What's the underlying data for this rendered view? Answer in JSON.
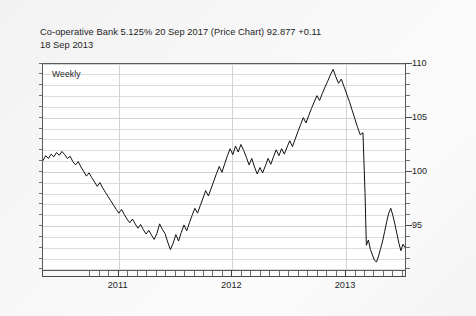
{
  "title": {
    "line1": "Co-operative Bank 5.125% 20 Sep 2017 (Price Chart) 92.877 +0.11",
    "line2": "18 Sep 2013"
  },
  "plot": {
    "frequency_label": "Weekly",
    "line_color": "#111111",
    "grid_color": "#dcdcdc",
    "axis_color": "#4a4a4a",
    "plot_background": "#ffffff",
    "page_background": "#f5f5f5"
  },
  "chart_data": {
    "type": "line",
    "title": "Co-operative Bank 5.125% 20 Sep 2017 (Price Chart) 92.877 +0.11",
    "subtitle": "18 Sep 2013",
    "annotation": "Weekly",
    "xlabel": "",
    "ylabel": "",
    "series_name": "Price",
    "last_price": 92.877,
    "change": 0.11,
    "as_of_date": "18 Sep 2013",
    "grid": true,
    "legend": "none",
    "y_axis_side": "right",
    "ylim": [
      90.8,
      110
    ],
    "yticks_major": [
      95,
      100,
      105,
      110
    ],
    "ytick_labels": [
      "95",
      "100",
      "105",
      "110"
    ],
    "ytick_minor_step": 1,
    "xlim": [
      "2010-09",
      "2013-09"
    ],
    "xticks_major": [
      "2011",
      "2012",
      "2013"
    ],
    "xtick_labels": [
      "2011",
      "2012",
      "2013"
    ],
    "xtick_minor_step": "1 month",
    "x": [
      "2010-09",
      "2010-10",
      "2010-11",
      "2010-12",
      "2011-01",
      "2011-02",
      "2011-03",
      "2011-04",
      "2011-05",
      "2011-06",
      "2011-07",
      "2011-08",
      "2011-09",
      "2011-10",
      "2011-11",
      "2011-12",
      "2012-01",
      "2012-02",
      "2012-03",
      "2012-04",
      "2012-05",
      "2012-06",
      "2012-07",
      "2012-08",
      "2012-09",
      "2012-10",
      "2012-11",
      "2012-12",
      "2013-01",
      "2013-02",
      "2013-03",
      "2013-04",
      "2013-05",
      "2013-06",
      "2013-07",
      "2013-08",
      "2013-09"
    ],
    "values": [
      101.0,
      101.5,
      101.2,
      100.3,
      99.2,
      98.3,
      97.4,
      96.2,
      95.3,
      94.6,
      94.2,
      93.4,
      94.1,
      95.6,
      97.4,
      99.3,
      101.3,
      102.4,
      102.0,
      101.0,
      99.9,
      100.6,
      101.5,
      102.0,
      101.4,
      102.6,
      104.5,
      105.6,
      106.6,
      107.3,
      108.3,
      109.5,
      108.2,
      104.0,
      92.8,
      91.6,
      92.9
    ],
    "points": [
      [
        0.0,
        101.0
      ],
      [
        0.008,
        101.45
      ],
      [
        0.016,
        101.2
      ],
      [
        0.024,
        101.6
      ],
      [
        0.032,
        101.35
      ],
      [
        0.04,
        101.75
      ],
      [
        0.048,
        101.5
      ],
      [
        0.056,
        101.85
      ],
      [
        0.064,
        101.55
      ],
      [
        0.072,
        101.2
      ],
      [
        0.08,
        101.4
      ],
      [
        0.088,
        100.9
      ],
      [
        0.096,
        100.6
      ],
      [
        0.104,
        100.9
      ],
      [
        0.112,
        100.4
      ],
      [
        0.12,
        100.0
      ],
      [
        0.128,
        99.55
      ],
      [
        0.136,
        99.85
      ],
      [
        0.144,
        99.4
      ],
      [
        0.152,
        99.0
      ],
      [
        0.16,
        98.6
      ],
      [
        0.168,
        98.95
      ],
      [
        0.176,
        98.45
      ],
      [
        0.184,
        98.05
      ],
      [
        0.192,
        97.65
      ],
      [
        0.2,
        97.25
      ],
      [
        0.208,
        96.85
      ],
      [
        0.216,
        96.45
      ],
      [
        0.224,
        96.1
      ],
      [
        0.232,
        96.45
      ],
      [
        0.24,
        95.95
      ],
      [
        0.248,
        95.55
      ],
      [
        0.256,
        95.2
      ],
      [
        0.264,
        95.55
      ],
      [
        0.272,
        95.1
      ],
      [
        0.28,
        94.7
      ],
      [
        0.288,
        95.05
      ],
      [
        0.296,
        94.55
      ],
      [
        0.304,
        94.15
      ],
      [
        0.312,
        94.5
      ],
      [
        0.32,
        94.05
      ],
      [
        0.328,
        93.65
      ],
      [
        0.336,
        94.2
      ],
      [
        0.344,
        95.1
      ],
      [
        0.352,
        94.6
      ],
      [
        0.36,
        94.2
      ],
      [
        0.368,
        93.4
      ],
      [
        0.376,
        92.7
      ],
      [
        0.384,
        93.3
      ],
      [
        0.392,
        94.1
      ],
      [
        0.4,
        93.5
      ],
      [
        0.408,
        94.3
      ],
      [
        0.416,
        95.0
      ],
      [
        0.424,
        94.45
      ],
      [
        0.432,
        95.2
      ],
      [
        0.44,
        95.9
      ],
      [
        0.448,
        96.55
      ],
      [
        0.456,
        96.1
      ],
      [
        0.464,
        96.8
      ],
      [
        0.472,
        97.5
      ],
      [
        0.48,
        98.2
      ],
      [
        0.488,
        97.7
      ],
      [
        0.496,
        98.4
      ],
      [
        0.504,
        99.1
      ],
      [
        0.512,
        99.8
      ],
      [
        0.52,
        100.45
      ],
      [
        0.528,
        99.9
      ],
      [
        0.536,
        100.7
      ],
      [
        0.544,
        101.45
      ],
      [
        0.552,
        102.1
      ],
      [
        0.56,
        101.55
      ],
      [
        0.568,
        102.35
      ],
      [
        0.576,
        101.8
      ],
      [
        0.584,
        102.5
      ],
      [
        0.592,
        101.95
      ],
      [
        0.6,
        101.3
      ],
      [
        0.608,
        100.6
      ],
      [
        0.616,
        101.2
      ],
      [
        0.624,
        100.4
      ],
      [
        0.632,
        99.75
      ],
      [
        0.64,
        100.35
      ],
      [
        0.648,
        99.85
      ],
      [
        0.656,
        100.5
      ],
      [
        0.664,
        101.2
      ],
      [
        0.672,
        100.65
      ],
      [
        0.68,
        101.35
      ],
      [
        0.688,
        102.0
      ],
      [
        0.696,
        101.45
      ],
      [
        0.704,
        102.1
      ],
      [
        0.712,
        101.6
      ],
      [
        0.72,
        102.25
      ],
      [
        0.728,
        102.85
      ],
      [
        0.736,
        102.3
      ],
      [
        0.744,
        103.0
      ],
      [
        0.752,
        103.7
      ],
      [
        0.76,
        104.35
      ],
      [
        0.768,
        105.0
      ],
      [
        0.776,
        104.5
      ],
      [
        0.784,
        105.2
      ],
      [
        0.792,
        105.85
      ],
      [
        0.8,
        106.45
      ],
      [
        0.808,
        107.05
      ],
      [
        0.816,
        106.6
      ],
      [
        0.824,
        107.25
      ],
      [
        0.832,
        107.85
      ],
      [
        0.84,
        108.4
      ],
      [
        0.848,
        109.0
      ],
      [
        0.856,
        109.5
      ],
      [
        0.864,
        108.8
      ],
      [
        0.872,
        108.2
      ],
      [
        0.88,
        108.6
      ],
      [
        0.888,
        107.9
      ],
      [
        0.896,
        107.2
      ],
      [
        0.904,
        106.5
      ],
      [
        0.912,
        105.7
      ],
      [
        0.92,
        104.9
      ],
      [
        0.928,
        104.1
      ],
      [
        0.936,
        103.4
      ],
      [
        0.944,
        103.6
      ],
      [
        0.95,
        98.0
      ],
      [
        0.954,
        93.1
      ],
      [
        0.96,
        93.6
      ],
      [
        0.966,
        92.7
      ],
      [
        0.972,
        92.2
      ],
      [
        0.978,
        91.7
      ],
      [
        0.984,
        91.55
      ],
      [
        0.99,
        92.1
      ],
      [
        0.996,
        92.8
      ],
      [
        1.002,
        93.5
      ],
      [
        1.008,
        94.4
      ],
      [
        1.014,
        95.3
      ],
      [
        1.02,
        96.1
      ],
      [
        1.026,
        96.55
      ],
      [
        1.032,
        95.9
      ],
      [
        1.038,
        95.1
      ],
      [
        1.044,
        94.2
      ],
      [
        1.05,
        93.3
      ],
      [
        1.056,
        92.6
      ],
      [
        1.062,
        93.2
      ],
      [
        1.068,
        92.9
      ]
    ]
  }
}
